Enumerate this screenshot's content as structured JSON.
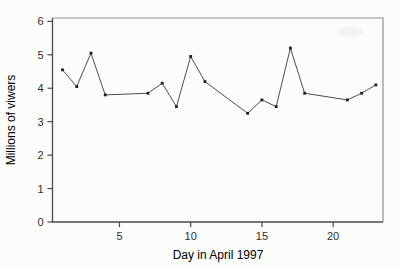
{
  "page": {
    "background": "#fcfcfb"
  },
  "chart_data": {
    "type": "line",
    "xlabel": "Day in April 1997",
    "ylabel": "Millions of viwers",
    "x": [
      1,
      2,
      3,
      4,
      7,
      8,
      9,
      10,
      11,
      14,
      15,
      16,
      17,
      18,
      21,
      22,
      23
    ],
    "y": [
      4.55,
      4.05,
      5.05,
      3.8,
      3.85,
      4.15,
      3.45,
      4.95,
      4.2,
      3.25,
      3.65,
      3.45,
      5.2,
      3.85,
      3.65,
      3.85,
      4.1
    ],
    "xticks": [
      5,
      10,
      15,
      20
    ],
    "yticks": [
      0,
      1,
      2,
      3,
      4,
      5,
      6
    ],
    "xlim": [
      0.3,
      23.5
    ],
    "ylim": [
      0,
      6.1
    ],
    "grid": false,
    "legend": "none",
    "marker": "square-dot",
    "colors": {
      "line": "#4d4d4d",
      "marker": "#1f1f1f",
      "axis_dark": "#4a4a4a",
      "axis_light": "#909090",
      "text": "#2e2e2e"
    }
  }
}
